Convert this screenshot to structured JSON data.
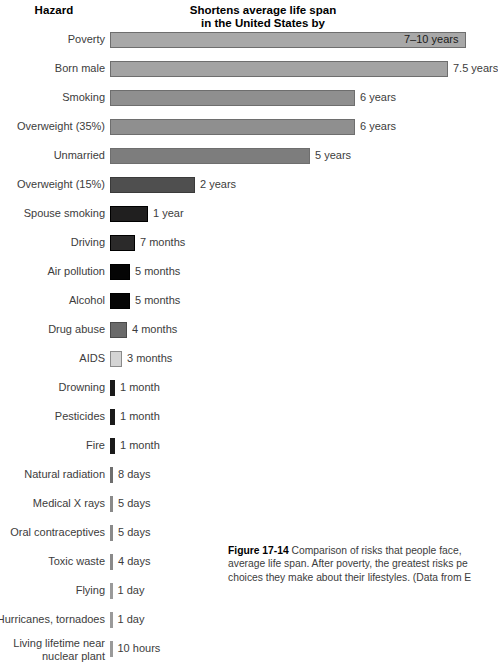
{
  "headers": {
    "hazard": "Hazard",
    "main_line1": "Shortens average life span",
    "main_line2": "in the United States by"
  },
  "caption": {
    "figure_number": "Figure 17-14",
    "text": " Comparison of risks that people face, average life span. After poverty, the greatest risks pe choices they make about their lifestyles. (Data from E"
  },
  "chart_data": {
    "type": "bar",
    "orientation": "horizontal",
    "title": "Shortens average life span in the United States by",
    "xlabel": "",
    "ylabel": "Hazard",
    "grid": false,
    "legend": false,
    "categories": [
      "Poverty",
      "Born male",
      "Smoking",
      "Overweight (35%)",
      "Unmarried",
      "Overweight (15%)",
      "Spouse smoking",
      "Driving",
      "Air pollution",
      "Alcohol",
      "Drug abuse",
      "AIDS",
      "Drowning",
      "Pesticides",
      "Fire",
      "Natural radiation",
      "Medical X rays",
      "Oral contraceptives",
      "Toxic waste",
      "Flying",
      "Hurricanes, tornadoes",
      "Living lifetime near\nnuclear plant"
    ],
    "value_labels": [
      "7–10 years",
      "7.5 years",
      "6 years",
      "6 years",
      "5 years",
      "2 years",
      "1 year",
      "7 months",
      "5 months",
      "5 months",
      "4 months",
      "3 months",
      "1 month",
      "1 month",
      "1 month",
      "8 days",
      "5 days",
      "5 days",
      "4 days",
      "1 day",
      "1 day",
      "10 hours"
    ],
    "values_years": [
      8.5,
      7.5,
      6,
      6,
      5,
      2,
      1,
      0.583,
      0.417,
      0.417,
      0.333,
      0.25,
      0.083,
      0.083,
      0.083,
      0.0219,
      0.0137,
      0.0137,
      0.011,
      0.00274,
      0.00274,
      0.00114
    ],
    "bar_px": [
      356,
      338,
      245,
      245,
      200,
      85,
      38,
      25,
      20,
      20,
      17,
      12,
      5,
      5,
      5,
      3,
      3,
      3,
      3,
      2.5,
      2.5,
      2.5
    ],
    "bar_colors": [
      "#a8a8a8",
      "#a3a3a3",
      "#8f8f8f",
      "#8f8f8f",
      "#7d7d7d",
      "#4f4f4f",
      "#201f1f",
      "#2b2a2a",
      "#050505",
      "#050505",
      "#6a6a6a",
      "#d4d4d4",
      "#1a1a1a",
      "#1a1a1a",
      "#1a1a1a",
      "#6e6e6e",
      "#8a8a8a",
      "#8a8a8a",
      "#8a8a8a",
      "#9a9a9a",
      "#9a9a9a",
      "#9a9a9a"
    ],
    "bar_borders": [
      "#6e6e6e",
      "#6e6e6e",
      "#6e6e6e",
      "#6e6e6e",
      "#6e6e6e",
      "#3a3a3a",
      "#000000",
      "#000000",
      "#000000",
      "#000000",
      "#4a4a4a",
      "#8a8a8a",
      "",
      "",
      "",
      "",
      "",
      "",
      "",
      "",
      "",
      ""
    ],
    "label_inside": [
      true,
      false,
      false,
      false,
      false,
      false,
      false,
      false,
      false,
      false,
      false,
      false,
      false,
      false,
      false,
      false,
      false,
      false,
      false,
      false,
      false,
      false
    ]
  }
}
